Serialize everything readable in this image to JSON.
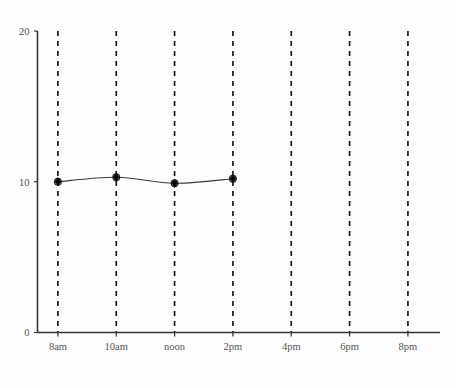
{
  "chart_data": {
    "type": "line",
    "title": "",
    "subtitle": "",
    "xlabel": "",
    "ylabel": "",
    "grid": "vertical-dashed",
    "legend_position": "none",
    "background_color": "#fdfdfd",
    "line_color": "#3a3a3a",
    "marker_color": "#111111",
    "axis_color": "#333333",
    "gridline_color": "#1a1a1a",
    "tick_label_color": "#555555",
    "x_tick_labels": [
      "8am",
      "10am",
      "noon",
      "2pm",
      "4pm",
      "6pm",
      "8pm"
    ],
    "x_positions": [
      0,
      1,
      2,
      3,
      4,
      5,
      6
    ],
    "xlim": [
      -0.35,
      6.55
    ],
    "y_tick_labels": [
      "0",
      "10",
      "20"
    ],
    "y_tick_values": [
      0,
      10,
      20
    ],
    "ylim": [
      0,
      20
    ],
    "series": [
      {
        "name": "series-1",
        "marker": "diamond-circle",
        "x": [
          "8am",
          "10am",
          "noon",
          "2pm"
        ],
        "x_values": [
          0,
          1,
          2,
          3
        ],
        "values": [
          10.0,
          10.3,
          9.9,
          10.2
        ]
      }
    ]
  }
}
